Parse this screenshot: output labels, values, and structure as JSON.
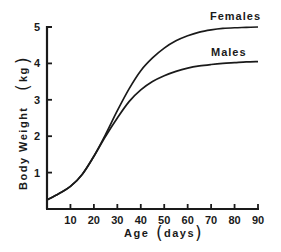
{
  "chart_data": {
    "type": "line",
    "title": "",
    "xlabel": "Age",
    "xlabel_unit": "days",
    "ylabel": "Body Weight",
    "ylabel_unit": "kg",
    "xlim": [
      0,
      90
    ],
    "ylim": [
      0,
      5
    ],
    "x_ticks": [
      10,
      20,
      30,
      40,
      50,
      60,
      70,
      80,
      90
    ],
    "y_ticks": [
      1,
      2,
      3,
      4,
      5
    ],
    "grid": false,
    "legend": "inline labels at curve ends",
    "x": [
      0,
      5,
      10,
      15,
      20,
      25,
      30,
      35,
      40,
      45,
      50,
      55,
      60,
      65,
      70,
      75,
      80,
      85,
      90
    ],
    "series": [
      {
        "name": "Females",
        "values": [
          0.25,
          0.42,
          0.62,
          0.95,
          1.45,
          2.05,
          2.7,
          3.3,
          3.8,
          4.15,
          4.42,
          4.62,
          4.76,
          4.86,
          4.92,
          4.96,
          4.98,
          4.99,
          5.0
        ]
      },
      {
        "name": "Males",
        "values": [
          0.25,
          0.42,
          0.62,
          0.95,
          1.45,
          2.0,
          2.5,
          2.95,
          3.27,
          3.5,
          3.66,
          3.78,
          3.87,
          3.93,
          3.97,
          4.0,
          4.02,
          4.04,
          4.05
        ]
      }
    ]
  },
  "labels": {
    "x_axis": "Age",
    "x_unit": "days",
    "y_axis": "Body  Weight",
    "y_unit": "kg",
    "females": "Females",
    "males": "Males"
  },
  "colors": {
    "line": "#1a1a1a",
    "background": "#ffffff"
  }
}
